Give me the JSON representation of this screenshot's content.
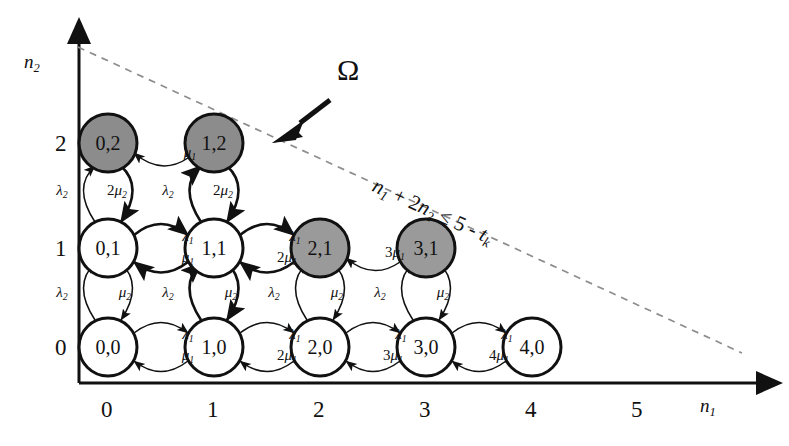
{
  "figure": {
    "region_label": "Ω",
    "constraint_text": "n₁ + 2n₂ ≤ 5 - tₖ",
    "constraint_parts": {
      "lhs1": "n",
      "lhs1sub": "1",
      "plus": "+",
      "coef": "2",
      "lhs2": "n",
      "lhs2sub": "2",
      "rel": "≤",
      "rhs": "5 - ",
      "t": "t",
      "tsub": "k"
    }
  },
  "colors": {
    "background": "#ffffff",
    "stroke": "#111111",
    "node_fill_plain": "#ffffff",
    "node_fill_boundary": "#9a9a9a",
    "node_fill_boundary_dark": "#8c8c8c",
    "dashed_line": "#8d8d8d",
    "thin_arrow": "#3a3a3a"
  },
  "axes": {
    "x": {
      "name": "n₁",
      "name_base": "n",
      "name_sub": "1",
      "ticks": [
        "0",
        "1",
        "2",
        "3",
        "4",
        "5"
      ]
    },
    "y": {
      "name": "n₂",
      "name_base": "n",
      "name_sub": "2",
      "ticks": [
        "0",
        "1",
        "2"
      ]
    }
  },
  "chart_data": {
    "type": "diagram",
    "xlabel": "n1",
    "ylabel": "n2",
    "xlim": [
      0,
      5
    ],
    "ylim": [
      0,
      2
    ],
    "grid": false,
    "nodes": [
      {
        "id": "0,0",
        "label": "0,0",
        "n1": 0,
        "n2": 0,
        "shaded": false
      },
      {
        "id": "1,0",
        "label": "1,0",
        "n1": 1,
        "n2": 0,
        "shaded": false
      },
      {
        "id": "2,0",
        "label": "2,0",
        "n1": 2,
        "n2": 0,
        "shaded": false
      },
      {
        "id": "3,0",
        "label": "3,0",
        "n1": 3,
        "n2": 0,
        "shaded": false
      },
      {
        "id": "4,0",
        "label": "4,0",
        "n1": 4,
        "n2": 0,
        "shaded": false
      },
      {
        "id": "0,1",
        "label": "0,1",
        "n1": 0,
        "n2": 1,
        "shaded": false
      },
      {
        "id": "1,1",
        "label": "1,1",
        "n1": 1,
        "n2": 1,
        "shaded": false
      },
      {
        "id": "2,1",
        "label": "2,1",
        "n1": 2,
        "n2": 1,
        "shaded": true
      },
      {
        "id": "3,1",
        "label": "3,1",
        "n1": 3,
        "n2": 1,
        "shaded": true
      },
      {
        "id": "0,2",
        "label": "0,2",
        "n1": 0,
        "n2": 2,
        "shaded": true
      },
      {
        "id": "1,2",
        "label": "1,2",
        "n1": 1,
        "n2": 2,
        "shaded": true
      }
    ],
    "edge_labels": {
      "row0_forward": [
        "λ₁",
        "λ₁",
        "λ₁",
        "λ₁"
      ],
      "row0_backward": [
        "μ₁",
        "2μ₁",
        "3μ₁",
        "4μ₁"
      ],
      "row1_forward": [
        "λ₁",
        "λ₁"
      ],
      "row1_backward": [
        "μ₁",
        "2μ₁",
        "3μ₁"
      ],
      "row2_backward": [
        "μ₁"
      ],
      "vertical_up_0_1": [
        "λ₂",
        "λ₂",
        "λ₂",
        "λ₂"
      ],
      "vertical_down_1_0": [
        "μ₂",
        "μ₂",
        "μ₂",
        "μ₂"
      ],
      "vertical_up_1_2": [
        "λ₂",
        "λ₂"
      ],
      "vertical_down_2_1": [
        "2μ₂",
        "2μ₂"
      ]
    }
  },
  "rate_labels": [
    {
      "id": "r0_l1_a",
      "base": "λ",
      "sub": "1",
      "pre": "",
      "x": 188,
      "y": 334
    },
    {
      "id": "r0_m1_a",
      "base": "μ",
      "sub": "1",
      "pre": "",
      "x": 188,
      "y": 355
    },
    {
      "id": "r0_l1_b",
      "base": "λ",
      "sub": "1",
      "pre": "",
      "x": 295,
      "y": 334
    },
    {
      "id": "r0_m1_b",
      "base": "μ",
      "sub": "1",
      "pre": "2",
      "x": 287,
      "y": 355
    },
    {
      "id": "r0_l1_c",
      "base": "λ",
      "sub": "1",
      "pre": "",
      "x": 401,
      "y": 334
    },
    {
      "id": "r0_m1_c",
      "base": "μ",
      "sub": "1",
      "pre": "3",
      "x": 393,
      "y": 355
    },
    {
      "id": "r0_l1_d",
      "base": "λ",
      "sub": "1",
      "pre": "",
      "x": 507,
      "y": 334
    },
    {
      "id": "r0_m1_d",
      "base": "μ",
      "sub": "1",
      "pre": "4",
      "x": 499,
      "y": 355
    },
    {
      "id": "r1_l1_a",
      "base": "λ",
      "sub": "1",
      "pre": "",
      "x": 188,
      "y": 236
    },
    {
      "id": "r1_m1_a",
      "base": "μ",
      "sub": "1",
      "pre": "",
      "x": 188,
      "y": 257
    },
    {
      "id": "r1_l1_b",
      "base": "λ",
      "sub": "1",
      "pre": "",
      "x": 295,
      "y": 236
    },
    {
      "id": "r1_m1_b",
      "base": "μ",
      "sub": "1",
      "pre": "2",
      "x": 287,
      "y": 257
    },
    {
      "id": "r1_m1_c",
      "base": "μ",
      "sub": "1",
      "pre": "3",
      "x": 395,
      "y": 252
    },
    {
      "id": "r2_m1_a",
      "base": "μ",
      "sub": "1",
      "pre": "",
      "x": 190,
      "y": 152
    },
    {
      "id": "v01_l2_a",
      "base": "λ",
      "sub": "2",
      "pre": "",
      "x": 62,
      "y": 292
    },
    {
      "id": "v01_m2_a",
      "base": "μ",
      "sub": "2",
      "pre": "",
      "x": 125,
      "y": 292
    },
    {
      "id": "v01_l2_b",
      "base": "λ",
      "sub": "2",
      "pre": "",
      "x": 168,
      "y": 292
    },
    {
      "id": "v01_m2_b",
      "base": "μ",
      "sub": "2",
      "pre": "",
      "x": 231,
      "y": 292
    },
    {
      "id": "v01_l2_c",
      "base": "λ",
      "sub": "2",
      "pre": "",
      "x": 274,
      "y": 292
    },
    {
      "id": "v01_m2_c",
      "base": "μ",
      "sub": "2",
      "pre": "",
      "x": 337,
      "y": 292
    },
    {
      "id": "v01_l2_d",
      "base": "λ",
      "sub": "2",
      "pre": "",
      "x": 380,
      "y": 292
    },
    {
      "id": "v01_m2_d",
      "base": "μ",
      "sub": "2",
      "pre": "",
      "x": 443,
      "y": 292
    },
    {
      "id": "v12_l2_a",
      "base": "λ",
      "sub": "2",
      "pre": "",
      "x": 62,
      "y": 190
    },
    {
      "id": "v12_m2_a",
      "base": "μ",
      "sub": "2",
      "pre": "2",
      "x": 117,
      "y": 190
    },
    {
      "id": "v12_l2_b",
      "base": "λ",
      "sub": "2",
      "pre": "",
      "x": 168,
      "y": 190
    },
    {
      "id": "v12_m2_b",
      "base": "μ",
      "sub": "2",
      "pre": "2",
      "x": 223,
      "y": 190
    }
  ]
}
